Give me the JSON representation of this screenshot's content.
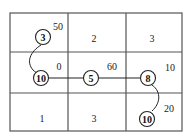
{
  "grid": {
    "rows": 3,
    "cols": 3,
    "cells": [
      {
        "row": 0,
        "col": 0,
        "label": "",
        "corner_value": "50"
      },
      {
        "row": 0,
        "col": 1,
        "label": "2",
        "corner_value": ""
      },
      {
        "row": 0,
        "col": 2,
        "label": "3",
        "corner_value": ""
      },
      {
        "row": 1,
        "col": 0,
        "label": "",
        "corner_value": "0"
      },
      {
        "row": 1,
        "col": 1,
        "label": "",
        "corner_value": "60"
      },
      {
        "row": 1,
        "col": 2,
        "label": "",
        "corner_value": "10"
      },
      {
        "row": 2,
        "col": 0,
        "label": "1",
        "corner_value": ""
      },
      {
        "row": 2,
        "col": 1,
        "label": "3",
        "corner_value": ""
      },
      {
        "row": 2,
        "col": 2,
        "label": "",
        "corner_value": "20"
      }
    ]
  },
  "nodes": [
    {
      "id": "n1",
      "label": "3",
      "cell": [
        0,
        0
      ]
    },
    {
      "id": "n2",
      "label": "10",
      "cell": [
        1,
        0
      ]
    },
    {
      "id": "n3",
      "label": "5",
      "cell": [
        1,
        1
      ]
    },
    {
      "id": "n4",
      "label": "8",
      "cell": [
        1,
        2
      ]
    },
    {
      "id": "n5",
      "label": "10",
      "cell": [
        2,
        2
      ]
    }
  ],
  "edges": [
    {
      "from": "n1",
      "to": "n2",
      "style": "curve"
    },
    {
      "from": "n2",
      "to": "n3",
      "style": "straight"
    },
    {
      "from": "n3",
      "to": "n4",
      "style": "straight"
    },
    {
      "from": "n4",
      "to": "n5",
      "style": "curve"
    }
  ],
  "labels": {
    "r0c0_corner": "50",
    "r0c1_label": "2",
    "r0c2_label": "3",
    "r1c0_corner": "0",
    "r1c1_corner": "60",
    "r1c2_corner": "10",
    "r2c0_label": "1",
    "r2c1_label": "3",
    "r2c2_corner": "20",
    "node_1": "3",
    "node_2": "10",
    "node_3": "5",
    "node_4": "8",
    "node_5": "10"
  }
}
